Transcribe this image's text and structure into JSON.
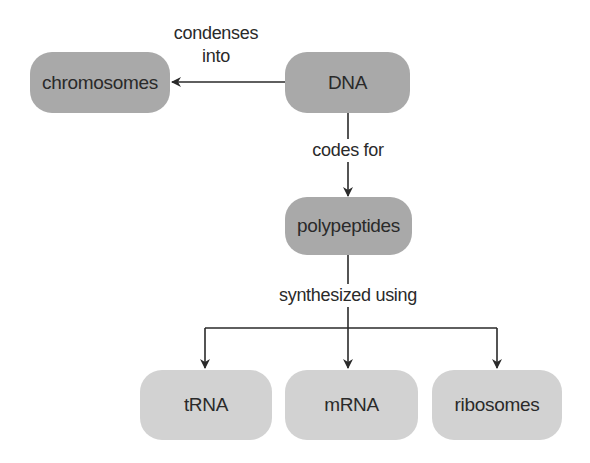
{
  "diagram": {
    "nodes": [
      {
        "id": "chromosomes",
        "label": "chromosomes",
        "shade": "dark"
      },
      {
        "id": "dna",
        "label": "DNA",
        "shade": "dark"
      },
      {
        "id": "polypeptides",
        "label": "polypeptides",
        "shade": "dark"
      },
      {
        "id": "trna",
        "label": "tRNA",
        "shade": "light"
      },
      {
        "id": "mrna",
        "label": "mRNA",
        "shade": "light"
      },
      {
        "id": "ribosomes",
        "label": "ribosomes",
        "shade": "light"
      }
    ],
    "edges": [
      {
        "from": "dna",
        "to": "chromosomes",
        "label_line1": "condenses",
        "label_line2": "into"
      },
      {
        "from": "dna",
        "to": "polypeptides",
        "label": "codes for"
      },
      {
        "from": "polypeptides",
        "to": [
          "trna",
          "mrna",
          "ribosomes"
        ],
        "label": "synthesized using"
      }
    ],
    "colors": {
      "dark_node": "#a9a9a9",
      "light_node": "#d2d2d2",
      "line": "#2a2a2a",
      "text": "#2a2a2a"
    }
  }
}
